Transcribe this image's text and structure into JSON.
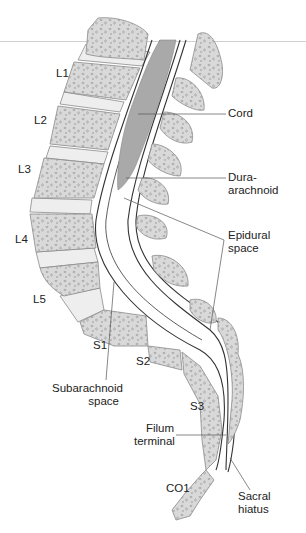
{
  "figure": {
    "type": "sagittal spine anatomy",
    "colors": {
      "bone": "#d9d9d9",
      "bone_outline": "#8a8a8a",
      "disc": "#eeeeee",
      "cord": "#a9a9a9",
      "lines": "#333333",
      "leader": "#555555"
    }
  },
  "vertebra_labels": {
    "l1": "L1",
    "l2": "L2",
    "l3": "L3",
    "l4": "L4",
    "l5": "L5",
    "s1": "S1",
    "s2": "S2",
    "s3": "S3",
    "co1": "CO1"
  },
  "callouts": {
    "cord": "Cord",
    "dura_1": "Dura-",
    "dura_2": "arachnoid",
    "epidural_1": "Epidural",
    "epidural_2": "space",
    "subarachnoid_1": "Subarachnoid",
    "subarachnoid_2": "space",
    "filum_1": "Filum",
    "filum_2": "terminal",
    "sacral_1": "Sacral",
    "sacral_2": "hiatus"
  }
}
